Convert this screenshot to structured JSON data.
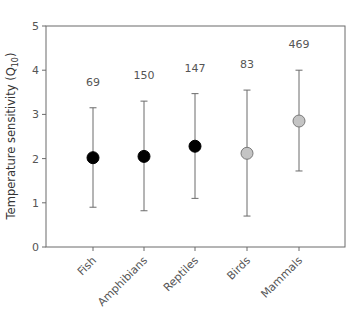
{
  "chart_data": {
    "type": "scatter",
    "title": "",
    "xlabel": "",
    "ylabel": "Temperature sensitivity (Q10)",
    "ylabel_main": "Temperature sensitivity (Q",
    "ylabel_sub": "10",
    "ylabel_close": ")",
    "ylim": [
      0,
      5
    ],
    "yticks": [
      "0",
      "1",
      "2",
      "3",
      "4",
      "5"
    ],
    "grid": false,
    "categories": [
      "Fish",
      "Amphibians",
      "Reptiles",
      "Birds",
      "Mammals"
    ],
    "values": [
      2.02,
      2.05,
      2.28,
      2.12,
      2.85
    ],
    "error_low": [
      0.9,
      0.82,
      1.1,
      0.7,
      1.72
    ],
    "error_high": [
      3.15,
      3.3,
      3.47,
      3.55,
      4.0
    ],
    "n_labels": [
      "69",
      "150",
      "147",
      "83",
      "469"
    ],
    "marker_colors": [
      "#000000",
      "#000000",
      "#000000",
      "#c4c4c4",
      "#c4c4c4"
    ],
    "annotations": "Sample sizes shown above each error bar; ectotherms black markers, endotherms gray markers"
  }
}
